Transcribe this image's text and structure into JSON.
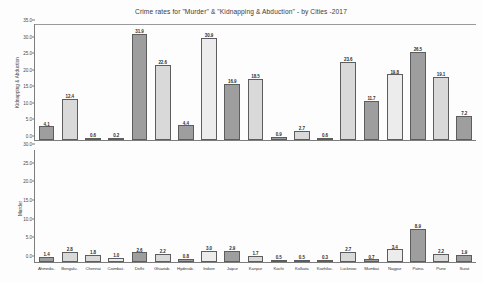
{
  "chart_data": {
    "type": "bar",
    "title": "Crime rates for \"Murder\" & \"Kidnapping & Abduction\" - by Cities -2017",
    "categories": [
      "Ahmeda..",
      "Bengalu..",
      "Chennai",
      "Coimbat..",
      "Delhi",
      "Ghaziab..",
      "Hyderab..",
      "Indore",
      "Jaipur",
      "Kanpur",
      "Kochi",
      "Kolkata",
      "Kozhiko..",
      "Lucknow",
      "Mumbai",
      "Nagpur",
      "Patna",
      "Pune",
      "Surat"
    ],
    "xlabel": "",
    "grid": false,
    "legend": "none",
    "panels": [
      {
        "name": "kidnapping-abduction",
        "ylabel": "Kidnapping & Abduction",
        "ylim": [
          0,
          35
        ],
        "yticks": [
          "35.0",
          "30.0",
          "25.0",
          "20.0",
          "15.0",
          "10.0",
          "5.0",
          "0.0"
        ],
        "ytick_values": [
          35,
          30,
          25,
          20,
          15,
          10,
          5,
          0
        ],
        "values": [
          4.1,
          12.4,
          0.6,
          0.2,
          31.9,
          22.6,
          4.4,
          30.9,
          16.9,
          18.5,
          0.9,
          2.7,
          0.6,
          23.6,
          11.7,
          19.8,
          26.5,
          19.1,
          7.2
        ],
        "labels": [
          "4.1",
          "12.4",
          "0.6",
          "0.2",
          "31.9",
          "22.6",
          "4.4",
          "30.9",
          "16.9",
          "18.5",
          "0.9",
          "2.7",
          "0.6",
          "23.6",
          "11.7",
          "19.8",
          "26.5",
          "19.1",
          "7.2"
        ],
        "shades": [
          "dark",
          "light",
          "light",
          "pale",
          "dark",
          "light",
          "dark",
          "pale",
          "dark",
          "light",
          "dark",
          "light",
          "dark",
          "light",
          "dark",
          "pale",
          "dark",
          "light",
          "dark"
        ]
      },
      {
        "name": "murder",
        "ylabel": "Murder",
        "ylim": [
          0,
          30
        ],
        "yticks": [
          "30.0",
          "25.0",
          "20.0",
          "15.0",
          "10.0",
          "5.0",
          "0.0"
        ],
        "ytick_values": [
          30,
          25,
          20,
          15,
          10,
          5,
          0
        ],
        "values": [
          1.4,
          2.8,
          1.8,
          1.0,
          2.6,
          2.2,
          0.8,
          3.0,
          2.9,
          1.7,
          0.5,
          0.5,
          0.3,
          2.7,
          0.7,
          3.4,
          8.9,
          2.2,
          1.9
        ],
        "labels": [
          "1.4",
          "2.8",
          "1.8",
          "1.0",
          "2.6",
          "2.2",
          "0.8",
          "3.0",
          "2.9",
          "1.7",
          "0.5",
          "0.5",
          "0.3",
          "2.7",
          "0.7",
          "3.4",
          "8.9",
          "2.2",
          "1.9"
        ],
        "shades": [
          "dark",
          "light",
          "light",
          "pale",
          "dark",
          "light",
          "dark",
          "pale",
          "dark",
          "light",
          "dark",
          "light",
          "dark",
          "light",
          "dark",
          "pale",
          "dark",
          "light",
          "dark"
        ]
      }
    ],
    "colors": {
      "bar_dark": "#9e9e9e",
      "bar_light": "#d9d9d9",
      "bar_pale": "#ececec",
      "axis": "#7d7d7d",
      "text": "#2f2f2f",
      "background": "#fdfdfd"
    }
  }
}
